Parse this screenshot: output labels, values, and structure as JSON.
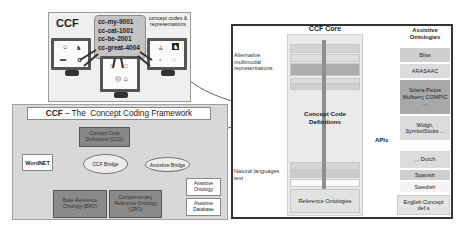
{
  "top_panel": {
    "title": "CCF",
    "concept_codes": [
      "cc-my-9001",
      "cc-cat-1001",
      "cc-be-2001",
      "cc-great-4004"
    ],
    "side_label": "concept codes & representations",
    "monitors": [
      {
        "icons": [
          "person-pictogram",
          "cat-pictogram",
          "bar-symbol",
          "great-symbol"
        ]
      },
      {
        "icons": [
          "text-symbol",
          "text-symbol",
          "face-symbol"
        ]
      },
      {
        "icons": [
          "person-photo",
          "cat-photo",
          "symbol",
          "symbol"
        ]
      }
    ]
  },
  "framework": {
    "title_bold": "CCF",
    "title_rest": " – The  Concept Coding Framework",
    "ccd": "Concept Code Definitions (CCD)",
    "wordnet": "WordNET",
    "ccf_bridge": "CCF Bridge",
    "assistive_bridge": "Assistive Bridge",
    "bro": "Base Reference Ontology (BRO)",
    "cro": "Complementary Reference Ontology (CRO)",
    "assistive_ontology": "Assistive Ontology",
    "assistive_database": "Assistive Database"
  },
  "core": {
    "title": "CCF Core",
    "alt_label": "Alternative multimodal representations",
    "nat_label": "Natural languages text",
    "ccd_label": "Concept Code Definitions",
    "ref_ont": "Reference Ontologies",
    "apis": "APIs",
    "assistive_title": "Assistive Ontologies",
    "assistive_items": [
      {
        "label": "Bliss",
        "color": "#cfcfcf"
      },
      {
        "label": "ARASAAC",
        "color": "#dcdcdc"
      },
      {
        "label": "Sclera Pictos Mulberry COMPIC ...",
        "color": "#a8a8a8"
      },
      {
        "label": "Widgit, SymbolSticks ...",
        "color": "#dcdcdc"
      }
    ],
    "language_items": [
      {
        "label": "... Dutch",
        "color": "#dcdcdc"
      },
      {
        "label": "Spanish",
        "color": "#cfcfcf"
      },
      {
        "label": "Swedish",
        "color": "#f4f4f4"
      },
      {
        "label": "English Concept def.s",
        "color": "#e4e4e4"
      }
    ]
  }
}
